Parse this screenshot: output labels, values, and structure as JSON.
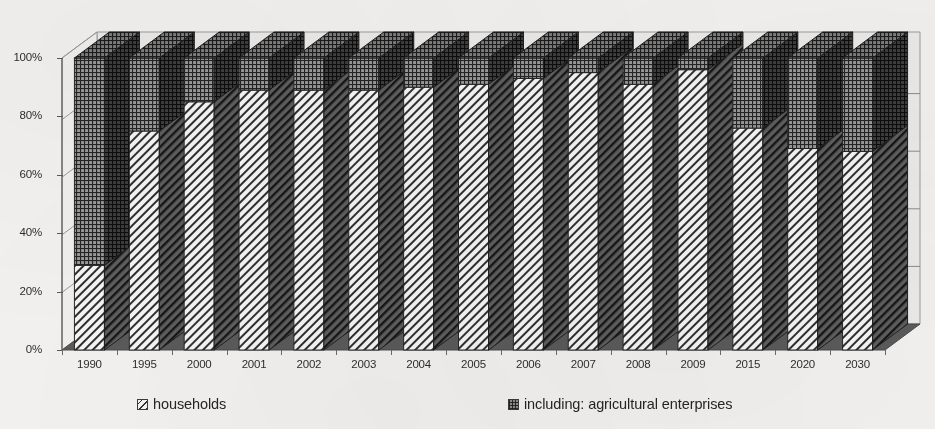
{
  "chart_data": {
    "type": "bar",
    "subtype": "stacked-100-percent-3d",
    "title": "",
    "xlabel": "",
    "ylabel": "",
    "ylim": [
      0,
      100
    ],
    "y_tick_labels": [
      "0%",
      "20%",
      "40%",
      "60%",
      "80%",
      "100%"
    ],
    "y_tick_values": [
      0,
      20,
      40,
      60,
      80,
      100
    ],
    "grid": true,
    "legend_position": "bottom",
    "categories": [
      "1990",
      "1995",
      "2000",
      "2001",
      "2002",
      "2003",
      "2004",
      "2005",
      "2006",
      "2007",
      "2008",
      "2009",
      "2015",
      "2020",
      "2030"
    ],
    "series": [
      {
        "name": "households",
        "pattern": "diagonal-hatch",
        "color": "#f4f4f4",
        "values": [
          29,
          75,
          85,
          89,
          89,
          89,
          90,
          91,
          93,
          95,
          91,
          96,
          76,
          69,
          68
        ]
      },
      {
        "name": "including: agricultural enterprises",
        "pattern": "cross-hatch",
        "color": "#8d8d8d",
        "values": [
          71,
          25,
          15,
          11,
          11,
          11,
          10,
          9,
          7,
          5,
          9,
          4,
          24,
          31,
          32
        ]
      }
    ]
  },
  "legend": {
    "items": [
      {
        "label": "households",
        "swatch": "diagonal-hatch-swatch"
      },
      {
        "label": "including: agricultural enterprises",
        "swatch": "cross-hatch-swatch"
      }
    ]
  },
  "colors": {
    "background": "#f2f1ef",
    "plot_background": "#ebeae8",
    "floor": "#5a5a5a",
    "frame": "#9a9a9a",
    "gridline": "#8a8a8a",
    "axis": "#5a5a5a",
    "text": "#2e2e2e"
  }
}
